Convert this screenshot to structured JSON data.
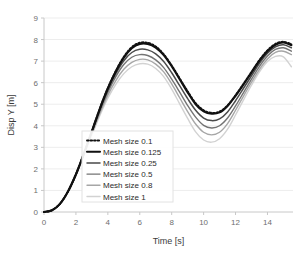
{
  "chart_data": {
    "type": "line",
    "title": "",
    "xlabel": "Time  [s]",
    "ylabel": "Disp Y [m]",
    "xlim": [
      0,
      15.6
    ],
    "ylim": [
      0,
      9
    ],
    "xticks": [
      0,
      2,
      4,
      6,
      8,
      10,
      12,
      14
    ],
    "yticks": [
      0,
      1,
      2,
      3,
      4,
      5,
      6,
      7,
      8,
      9
    ],
    "xtick_labels": [
      "0",
      "2",
      "4",
      "6",
      "8",
      "10",
      "12",
      "14"
    ],
    "ytick_labels": [
      "0",
      "1",
      "2",
      "3",
      "4",
      "5",
      "6",
      "7",
      "8",
      "9"
    ],
    "grid": "horizontal",
    "grid_color": "#ededed",
    "axis_color": "#c8c8c8",
    "background": "#ffffff",
    "legend_position": "lower-left-inside",
    "x": [
      0,
      0.5,
      1,
      1.5,
      2,
      2.5,
      3,
      3.5,
      4,
      4.5,
      5,
      5.5,
      6,
      6.5,
      7,
      7.5,
      8,
      8.5,
      9,
      9.5,
      10,
      10.5,
      11,
      11.5,
      12,
      12.5,
      13,
      13.5,
      14,
      14.5,
      15,
      15.5
    ],
    "series": [
      {
        "name": "Mesh size 0.1",
        "style": "dotted",
        "color": "#111111",
        "width": 1.9,
        "values": [
          0,
          0.08,
          0.38,
          0.95,
          1.75,
          2.72,
          3.75,
          4.8,
          5.75,
          6.55,
          7.2,
          7.65,
          7.85,
          7.85,
          7.68,
          7.32,
          6.8,
          6.2,
          5.6,
          5.05,
          4.72,
          4.6,
          4.66,
          4.95,
          5.42,
          5.95,
          6.5,
          7.05,
          7.5,
          7.8,
          7.9,
          7.78
        ]
      },
      {
        "name": "Mesh size 0.125",
        "style": "solid",
        "color": "#111111",
        "width": 2.1,
        "values": [
          0,
          0.08,
          0.38,
          0.95,
          1.75,
          2.72,
          3.75,
          4.8,
          5.74,
          6.52,
          7.16,
          7.6,
          7.8,
          7.8,
          7.63,
          7.28,
          6.76,
          6.16,
          5.55,
          5.0,
          4.67,
          4.56,
          4.62,
          4.92,
          5.39,
          5.92,
          6.47,
          7.02,
          7.46,
          7.76,
          7.86,
          7.74
        ]
      },
      {
        "name": "Mesh size 0.25",
        "style": "solid",
        "color": "#4a4a4a",
        "width": 1.5,
        "values": [
          0,
          0.08,
          0.38,
          0.94,
          1.74,
          2.7,
          3.72,
          4.75,
          5.66,
          6.42,
          7.02,
          7.4,
          7.55,
          7.52,
          7.34,
          6.98,
          6.46,
          5.86,
          5.26,
          4.72,
          4.36,
          4.24,
          4.32,
          4.64,
          5.16,
          5.74,
          6.32,
          6.9,
          7.36,
          7.66,
          7.76,
          7.62
        ]
      },
      {
        "name": "Mesh size 0.5",
        "style": "solid",
        "color": "#747474",
        "width": 1.4,
        "values": [
          0,
          0.08,
          0.37,
          0.93,
          1.72,
          2.67,
          3.68,
          4.68,
          5.56,
          6.28,
          6.84,
          7.18,
          7.3,
          7.26,
          7.06,
          6.7,
          6.16,
          5.56,
          4.94,
          4.4,
          4.02,
          3.9,
          4.0,
          4.36,
          4.92,
          5.54,
          6.16,
          6.76,
          7.24,
          7.54,
          7.62,
          7.46
        ]
      },
      {
        "name": "Mesh size 0.8",
        "style": "solid",
        "color": "#a6a6a6",
        "width": 1.4,
        "values": [
          0,
          0.08,
          0.37,
          0.92,
          1.7,
          2.64,
          3.62,
          4.58,
          5.42,
          6.1,
          6.62,
          6.94,
          7.08,
          7.06,
          6.86,
          6.5,
          5.94,
          5.3,
          4.66,
          4.08,
          3.7,
          3.58,
          3.7,
          4.1,
          4.72,
          5.38,
          6.02,
          6.62,
          7.1,
          7.4,
          7.46,
          7.3
        ]
      },
      {
        "name": "Mesh size 1",
        "style": "solid",
        "color": "#d2d2d2",
        "width": 1.4,
        "values": [
          0,
          0.08,
          0.36,
          0.91,
          1.68,
          2.6,
          3.56,
          4.48,
          5.28,
          5.92,
          6.42,
          6.74,
          6.88,
          6.86,
          6.66,
          6.28,
          5.7,
          5.02,
          4.34,
          3.72,
          3.34,
          3.24,
          3.4,
          3.84,
          4.5,
          5.2,
          5.88,
          6.5,
          6.98,
          7.22,
          7.2,
          6.74
        ]
      }
    ]
  },
  "legend": {
    "items": [
      {
        "label": "Mesh size 0.1"
      },
      {
        "label": "Mesh size 0.125"
      },
      {
        "label": "Mesh size 0.25"
      },
      {
        "label": "Mesh size 0.5"
      },
      {
        "label": "Mesh size 0.8"
      },
      {
        "label": "Mesh size 1"
      }
    ]
  }
}
